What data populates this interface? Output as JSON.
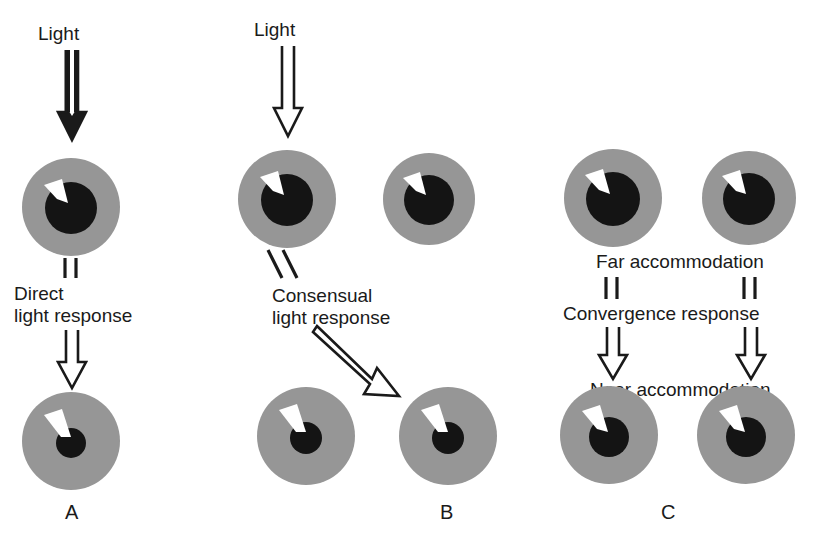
{
  "figure": {
    "background_color": "#ffffff",
    "iris_color": "#969696",
    "pupil_color": "#141414",
    "highlight_color": "#ffffff",
    "stroke_color": "#1a1a1a",
    "width": 827,
    "height": 551
  },
  "panels": [
    {
      "letter": "A",
      "letter_x": 74,
      "letter_y": 505,
      "stimulus_label": "Light",
      "response_label_line1": "Direct",
      "response_label_line2": "light response",
      "eyes": [
        {
          "name": "eye-a-top-left",
          "cx": 70,
          "cy": 206,
          "r": 49,
          "pupil_r": 26,
          "state": "dilated"
        },
        {
          "name": "eye-a-bottom-left",
          "cx": 70,
          "cy": 440,
          "r": 49,
          "pupil_r": 15,
          "state": "constricted"
        }
      ]
    },
    {
      "letter": "B",
      "letter_x": 447,
      "letter_y": 505,
      "stimulus_label": "Light",
      "response_label_line1": "Consensual",
      "response_label_line2": "light response",
      "eyes": [
        {
          "name": "eye-b-top-left",
          "cx": 286,
          "cy": 198,
          "r": 49,
          "pupil_r": 26,
          "state": "dilated"
        },
        {
          "name": "eye-b-top-right",
          "cx": 428,
          "cy": 198,
          "r": 46,
          "pupil_r": 25,
          "state": "dilated"
        },
        {
          "name": "eye-b-bottom-left",
          "cx": 305,
          "cy": 435,
          "r": 49,
          "pupil_r": 16,
          "state": "constricted"
        },
        {
          "name": "eye-b-bottom-right",
          "cx": 447,
          "cy": 435,
          "r": 49,
          "pupil_r": 16,
          "state": "constricted"
        }
      ]
    },
    {
      "letter": "C",
      "letter_x": 668,
      "letter_y": 505,
      "label_far": "Far accommodation",
      "label_convergence": "Convergence response",
      "label_near": "Near accommodation",
      "eyes": [
        {
          "name": "eye-c-top-left",
          "cx": 612,
          "cy": 197,
          "r": 49,
          "pupil_r": 27,
          "state": "dilated"
        },
        {
          "name": "eye-c-top-right",
          "cx": 748,
          "cy": 197,
          "r": 47,
          "pupil_r": 26,
          "state": "dilated"
        },
        {
          "name": "eye-c-bottom-left",
          "cx": 608,
          "cy": 434,
          "r": 49,
          "pupil_r": 20,
          "state": "mid"
        },
        {
          "name": "eye-c-bottom-right",
          "cx": 745,
          "cy": 434,
          "r": 49,
          "pupil_r": 20,
          "state": "mid"
        }
      ]
    }
  ],
  "labels": {
    "light_a": "Light",
    "light_b": "Light",
    "direct_line1": "Direct",
    "direct_line2": "light response",
    "consensual_line1": "Consensual",
    "consensual_line2": "light response",
    "far_accommodation": "Far accommodation",
    "convergence_response": "Convergence response",
    "near_accommodation": "Near accommodation",
    "letter_a": "A",
    "letter_b": "B",
    "letter_c": "C"
  },
  "icons": {
    "down_arrow": "hollow-down-arrow-icon",
    "diagonal_arrow": "hollow-diagonal-arrow-icon",
    "eye": "eye-icon"
  }
}
